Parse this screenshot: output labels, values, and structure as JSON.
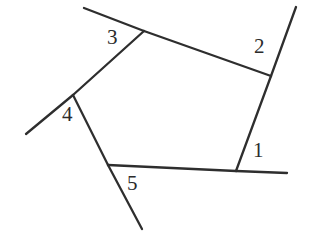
{
  "figure": {
    "canvas": {
      "width": 321,
      "height": 245,
      "background": "#ffffff"
    },
    "stroke": {
      "color": "#2e2e2e",
      "width": 2.3
    },
    "vertices": [
      {
        "id": "v1",
        "label": "1",
        "x": 236,
        "y": 171
      },
      {
        "id": "v2",
        "label": "2",
        "x": 271,
        "y": 76
      },
      {
        "id": "v3",
        "label": "3",
        "x": 144,
        "y": 31
      },
      {
        "id": "v4",
        "label": "4",
        "x": 73,
        "y": 95
      },
      {
        "id": "v5",
        "label": "5",
        "x": 108,
        "y": 165
      }
    ],
    "polygon_sides": [
      {
        "name": "side-1-2",
        "x1": 236,
        "y1": 171,
        "x2": 271,
        "y2": 76
      },
      {
        "name": "side-2-3",
        "x1": 271,
        "y1": 76,
        "x2": 144,
        "y2": 31
      },
      {
        "name": "side-3-4",
        "x1": 144,
        "y1": 31,
        "x2": 73,
        "y2": 95
      },
      {
        "name": "side-4-5",
        "x1": 73,
        "y1": 95,
        "x2": 108,
        "y2": 165
      },
      {
        "name": "side-5-1",
        "x1": 108,
        "y1": 165,
        "x2": 236,
        "y2": 171
      }
    ],
    "extensions": [
      {
        "name": "extension-at-1",
        "x1": 236,
        "y1": 171,
        "x2": 287,
        "y2": 173
      },
      {
        "name": "extension-at-2",
        "x1": 271,
        "y1": 76,
        "x2": 296,
        "y2": 7
      },
      {
        "name": "extension-at-3",
        "x1": 144,
        "y1": 31,
        "x2": 84,
        "y2": 8
      },
      {
        "name": "extension-at-4",
        "x1": 73,
        "y1": 95,
        "x2": 26,
        "y2": 134
      },
      {
        "name": "extension-at-5",
        "x1": 108,
        "y1": 165,
        "x2": 142,
        "y2": 229
      }
    ],
    "labels": [
      {
        "id": "label-1",
        "text": "1",
        "x": 253,
        "y": 140
      },
      {
        "id": "label-2",
        "text": "2",
        "x": 254,
        "y": 36
      },
      {
        "id": "label-3",
        "text": "3",
        "x": 107,
        "y": 27
      },
      {
        "id": "label-4",
        "text": "4",
        "x": 62,
        "y": 104
      },
      {
        "id": "label-5",
        "text": "5",
        "x": 127,
        "y": 173
      }
    ]
  }
}
